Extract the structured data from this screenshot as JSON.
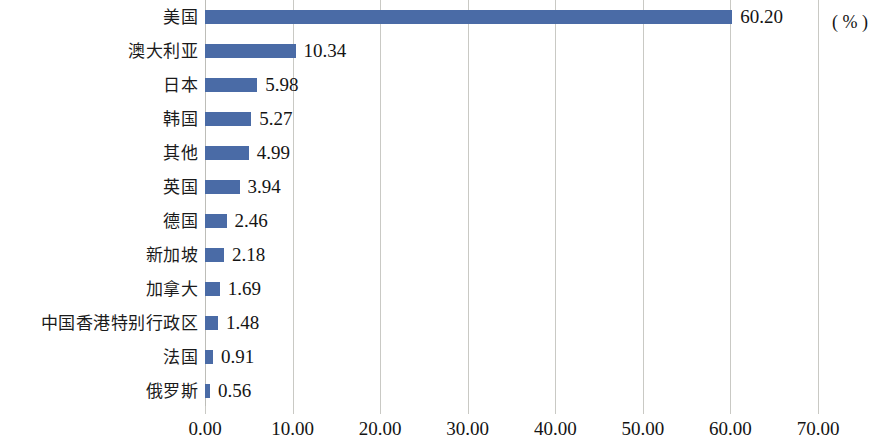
{
  "chart_data": {
    "type": "bar",
    "orientation": "horizontal",
    "title": "",
    "subtitle": "",
    "xlabel": "",
    "ylabel": "",
    "unit_label": "( % )",
    "xlim": [
      0,
      70
    ],
    "grid": true,
    "legend": null,
    "value_format": "0.00",
    "categories": [
      "美国",
      "澳大利亚",
      "日本",
      "韩国",
      "其他",
      "英国",
      "德国",
      "新加坡",
      "加拿大",
      "中国香港特别行政区",
      "法国",
      "俄罗斯"
    ],
    "values": [
      60.2,
      10.34,
      5.98,
      5.27,
      4.99,
      3.94,
      2.46,
      2.18,
      1.69,
      1.48,
      0.91,
      0.56
    ],
    "value_labels": [
      "60.20",
      "10.34",
      "5.98",
      "5.27",
      "4.99",
      "3.94",
      "2.46",
      "2.18",
      "1.69",
      "1.48",
      "0.91",
      "0.56"
    ],
    "xticks": [
      0,
      10,
      20,
      30,
      40,
      50,
      60,
      70
    ],
    "xtick_labels": [
      "0.00",
      "10.00",
      "20.00",
      "30.00",
      "40.00",
      "50.00",
      "60.00",
      "70.00"
    ],
    "colors": {
      "bar": "#4a6ba6",
      "gridline": "#c9c9c4",
      "text": "#141414",
      "background": "#ffffff"
    }
  }
}
